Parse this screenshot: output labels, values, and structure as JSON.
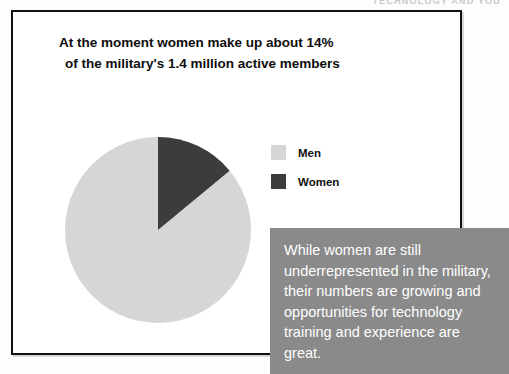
{
  "page": {
    "header_text": "TECHNOLOGY AND YOU"
  },
  "slide": {
    "title_line1": "At the moment women make up about 14%",
    "title_line2": "of the military's 1.4 million active members"
  },
  "legend": {
    "items": [
      {
        "label": "Men",
        "color": "#d6d6d6"
      },
      {
        "label": "Women",
        "color": "#3c3c3c"
      }
    ]
  },
  "callout": {
    "text": "While women are still underrepresented in the military, their numbers are growing and opportunities for technology training and experience are great."
  },
  "colors": {
    "panel_border": "#111111",
    "callout_background": "#8a8a8a",
    "callout_text": "#ffffff",
    "men_slice": "#d6d6d6",
    "women_slice": "#3c3c3c"
  },
  "chart_data": {
    "type": "pie",
    "title": "At the moment women make up about 14% of the military's 1.4 million active members",
    "categories": [
      "Men",
      "Women"
    ],
    "values": [
      86,
      14
    ],
    "unit": "percent",
    "total_label": "1.4 million active members",
    "colors": [
      "#d6d6d6",
      "#3c3c3c"
    ],
    "legend_position": "right",
    "start_angle_deg": 90,
    "direction": "counterclockwise",
    "grid": false
  }
}
